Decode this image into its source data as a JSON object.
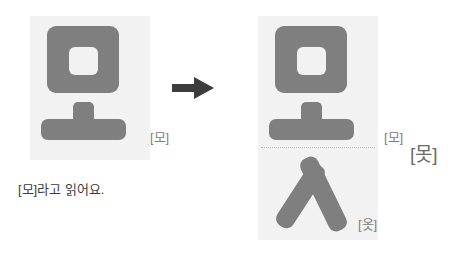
{
  "diagram": {
    "type": "hangul-syllable-composition",
    "colors": {
      "glyph": "#7f7f7f",
      "panel": "#f2f2f2",
      "arrow": "#3c3c3c",
      "label": "#808080",
      "label_strong": "#6b6b6b",
      "caption": "#3c3c3c",
      "divider": "#b9b9b9",
      "background": "#ffffff"
    }
  },
  "left_panel": {
    "name": "source-syllable",
    "glyph_text": "모",
    "components": [
      {
        "jamo": "ㅁ",
        "role": "initial-consonant",
        "name": "mieum"
      },
      {
        "jamo": "ㅗ",
        "role": "vowel",
        "name": "o"
      }
    ],
    "label": "[모]",
    "caption": "[모]라고 읽어요."
  },
  "arrow": {
    "name": "transform-arrow",
    "direction": "right",
    "glyph": "→"
  },
  "right_panel": {
    "name": "result-syllable",
    "glyph_text": "못",
    "components": [
      {
        "jamo": "ㅁ",
        "role": "initial-consonant",
        "name": "mieum"
      },
      {
        "jamo": "ㅗ",
        "role": "vowel",
        "name": "o"
      },
      {
        "jamo": "ㅅ",
        "role": "final-consonant",
        "name": "siot"
      }
    ],
    "label_top": "[모]",
    "label_bottom": "[옷]",
    "label_result": "[못]"
  }
}
